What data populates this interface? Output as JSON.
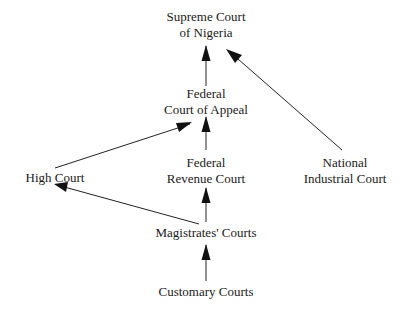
{
  "diagram": {
    "type": "hierarchy",
    "nodes": [
      {
        "id": "supreme",
        "line1": "Supreme Court",
        "line2": "of Nigeria",
        "x": 206,
        "y": 9
      },
      {
        "id": "appeal",
        "line1": "Federal",
        "line2": "Court of Appeal",
        "x": 206,
        "y": 86
      },
      {
        "id": "high",
        "line1": "High Court",
        "line2": "",
        "x": 55,
        "y": 170
      },
      {
        "id": "revenue",
        "line1": "Federal",
        "line2": "Revenue Court",
        "x": 206,
        "y": 155
      },
      {
        "id": "industrial",
        "line1": "National",
        "line2": "Industrial Court",
        "x": 345,
        "y": 155
      },
      {
        "id": "magistrates",
        "line1": "Magistrates' Courts",
        "line2": "",
        "x": 206,
        "y": 224
      },
      {
        "id": "customary",
        "line1": "Customary Courts",
        "line2": "",
        "x": 206,
        "y": 283
      }
    ],
    "edges": [
      {
        "from": "appeal",
        "to": "supreme"
      },
      {
        "from": "industrial",
        "to": "supreme"
      },
      {
        "from": "revenue",
        "to": "appeal"
      },
      {
        "from": "high",
        "to": "appeal"
      },
      {
        "from": "magistrates",
        "to": "revenue"
      },
      {
        "from": "magistrates",
        "to": "high"
      },
      {
        "from": "customary",
        "to": "magistrates"
      }
    ]
  }
}
